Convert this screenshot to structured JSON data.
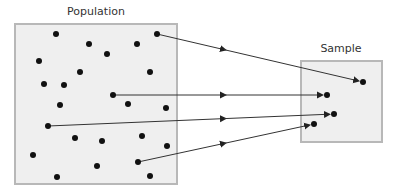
{
  "diagram": {
    "population": {
      "label": "Population",
      "label_pos": [
        96,
        5
      ],
      "box": {
        "x": 15,
        "y": 24,
        "w": 162,
        "h": 160
      },
      "dots": [
        [
          56,
          34
        ],
        [
          89,
          44
        ],
        [
          107,
          54
        ],
        [
          137,
          44
        ],
        [
          157,
          34
        ],
        [
          39,
          61
        ],
        [
          150,
          72
        ],
        [
          80,
          72
        ],
        [
          44,
          84
        ],
        [
          113,
          95
        ],
        [
          60,
          105
        ],
        [
          128,
          104
        ],
        [
          166,
          108
        ],
        [
          48,
          126
        ],
        [
          75,
          138
        ],
        [
          102,
          141
        ],
        [
          142,
          136
        ],
        [
          167,
          146
        ],
        [
          33,
          155
        ],
        [
          97,
          166
        ],
        [
          138,
          162
        ],
        [
          57,
          177
        ],
        [
          150,
          176
        ],
        [
          64,
          85
        ]
      ]
    },
    "sample": {
      "label": "Sample",
      "label_pos": [
        341,
        42
      ],
      "box": {
        "x": 301,
        "y": 61,
        "w": 81,
        "h": 81
      },
      "dots": [
        [
          363,
          82
        ],
        [
          327,
          95
        ],
        [
          334,
          114
        ],
        [
          314,
          124
        ]
      ]
    },
    "arrows": [
      {
        "from": [
          157,
          34
        ],
        "to": [
          363,
          82
        ]
      },
      {
        "from": [
          113,
          95
        ],
        "to": [
          327,
          95
        ]
      },
      {
        "from": [
          48,
          126
        ],
        "to": [
          334,
          114
        ]
      },
      {
        "from": [
          138,
          162
        ],
        "to": [
          314,
          124
        ]
      }
    ],
    "colors": {
      "box_fill": "#efefef",
      "box_stroke": "#b8b8b8",
      "dot": "#111111",
      "line": "#333333"
    }
  }
}
